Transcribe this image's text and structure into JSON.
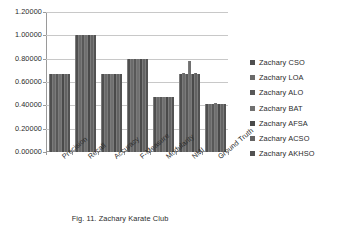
{
  "chart_data": {
    "type": "bar",
    "title": "",
    "xlabel": "",
    "ylabel": "",
    "ylim": [
      0.0,
      1.2
    ],
    "grid": true,
    "legend_position": "right",
    "categories": [
      "Precision",
      "Recall",
      "Accuracy",
      "F-Measure",
      "Modularity",
      "NMI",
      "Ground Truth"
    ],
    "ytick_labels": [
      "0.00000",
      "0.20000",
      "0.40000",
      "0.60000",
      "0.80000",
      "1.00000",
      "1.20000"
    ],
    "ytick_values": [
      0.0,
      0.2,
      0.4,
      0.6,
      0.8,
      1.0,
      1.2
    ],
    "series": [
      {
        "name": "Zachary CSO",
        "values": [
          0.667,
          1.0,
          0.667,
          0.8,
          0.469,
          0.67,
          0.412
        ]
      },
      {
        "name": "Zachary LOA",
        "values": [
          0.667,
          1.0,
          0.667,
          0.8,
          0.471,
          0.675,
          0.415
        ]
      },
      {
        "name": "Zachary ALO",
        "values": [
          0.667,
          1.0,
          0.667,
          0.8,
          0.47,
          0.672,
          0.413
        ]
      },
      {
        "name": "Zachary BAT",
        "values": [
          0.667,
          1.0,
          0.667,
          0.8,
          0.472,
          0.78,
          0.416
        ]
      },
      {
        "name": "Zachary AFSA",
        "values": [
          0.667,
          1.0,
          0.667,
          0.8,
          0.468,
          0.671,
          0.411
        ]
      },
      {
        "name": "Zachary ACSO",
        "values": [
          0.667,
          1.0,
          0.667,
          0.8,
          0.47,
          0.673,
          0.414
        ]
      },
      {
        "name": "Zachary AKHSO",
        "values": [
          0.667,
          1.0,
          0.667,
          0.8,
          0.469,
          0.67,
          0.412
        ]
      }
    ]
  },
  "legend": {
    "items": [
      {
        "label": "Zachary CSO"
      },
      {
        "label": "Zachary LOA"
      },
      {
        "label": "Zachary ALO"
      },
      {
        "label": "Zachary BAT"
      },
      {
        "label": "Zachary AFSA"
      },
      {
        "label": "Zachary ACSO"
      },
      {
        "label": "Zachary AKHSO"
      }
    ]
  },
  "caption": {
    "text": "Fig. 11. Zachary Karate Club"
  },
  "colors": {
    "bar": "#595959",
    "gridline": "#c8c8c8",
    "axis": "#9a9a9a",
    "text": "#2b2b2b"
  }
}
